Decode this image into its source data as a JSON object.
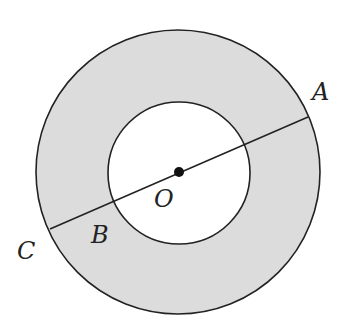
{
  "diagram": {
    "type": "concentric-circles-annulus",
    "colors": {
      "annulus_fill": "#dcdcdc",
      "inner_fill": "#ffffff",
      "stroke": "#222222",
      "background": "#ffffff"
    },
    "outer_circle": {
      "cx": 178,
      "cy": 172,
      "r": 142
    },
    "inner_circle": {
      "cx": 179,
      "cy": 173,
      "r": 71
    },
    "center_point": {
      "cx": 179,
      "cy": 172,
      "r": 5,
      "label": "O"
    },
    "segment": {
      "from": "C",
      "to": "A",
      "x1": 50,
      "y1": 229,
      "x2": 308,
      "y2": 117
    },
    "labels": {
      "A": "A",
      "B": "B",
      "C": "C",
      "O": "O"
    }
  }
}
